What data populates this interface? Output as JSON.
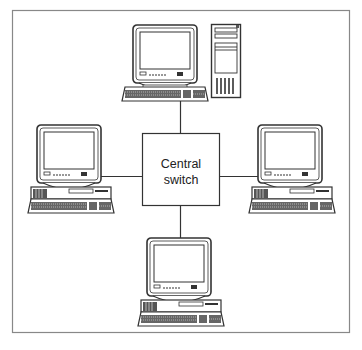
{
  "diagram": {
    "type": "star-network-topology",
    "colors": {
      "line": "#333333",
      "frame": "#888888",
      "background": "#ffffff"
    },
    "hub": {
      "label_line1": "Central",
      "label_line2": "switch"
    },
    "nodes": [
      {
        "id": "top",
        "kind": "desktop-with-tower",
        "position": "top"
      },
      {
        "id": "left",
        "kind": "desktop-computer",
        "position": "left"
      },
      {
        "id": "right",
        "kind": "desktop-computer",
        "position": "right"
      },
      {
        "id": "bottom",
        "kind": "desktop-computer",
        "position": "bottom"
      }
    ],
    "edges": [
      {
        "from": "top",
        "to": "hub"
      },
      {
        "from": "left",
        "to": "hub"
      },
      {
        "from": "right",
        "to": "hub"
      },
      {
        "from": "bottom",
        "to": "hub"
      }
    ]
  }
}
